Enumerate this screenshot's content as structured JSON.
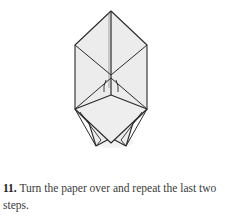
{
  "diagram": {
    "alt": "Origami diagram: folded paper with upper diamond and lower flaps",
    "fill_color": "#ececec",
    "stroke_color": "#2a2a2a"
  },
  "instruction": {
    "step_number": "11.",
    "text": " Turn the paper over and repeat the last two steps."
  }
}
